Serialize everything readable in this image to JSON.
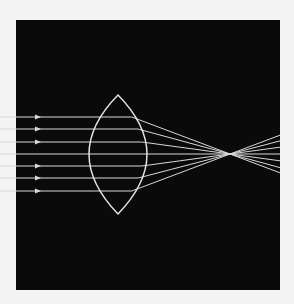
{
  "diagram": {
    "colors": {
      "page": "#f4f4f4",
      "background": "#0a0a0a",
      "ray": "#d8d8d8",
      "lens": "#e6e6e6"
    },
    "frame": {
      "x": 16,
      "y": 20,
      "width": 264,
      "height": 270
    },
    "lens": {
      "cx": 118,
      "top": 95,
      "bottom": 214,
      "half_width": 29,
      "center_y": 154
    },
    "focal_point": {
      "x": 230,
      "y": 154
    },
    "exit_x": 280,
    "rays": [
      {
        "y": 117,
        "arrow": true
      },
      {
        "y": 129,
        "arrow": true
      },
      {
        "y": 142,
        "arrow": true
      },
      {
        "y": 154,
        "arrow": false
      },
      {
        "y": 166,
        "arrow": true
      },
      {
        "y": 178,
        "arrow": true
      },
      {
        "y": 191,
        "arrow": true
      }
    ],
    "arrow_x": 40
  }
}
